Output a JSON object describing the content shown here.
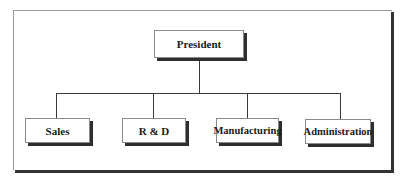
{
  "chart": {
    "root": {
      "label": "President"
    },
    "children": [
      {
        "label": "Sales"
      },
      {
        "label": "R & D"
      },
      {
        "label": "Manufacturing"
      },
      {
        "label": "Administration"
      }
    ]
  },
  "colors": {
    "box_fill": "#ffffff",
    "box_border": "#8a8a8a",
    "shadow": "#2e2e2e",
    "connector": "#3a3a3a",
    "text": "#1a1a1a"
  }
}
